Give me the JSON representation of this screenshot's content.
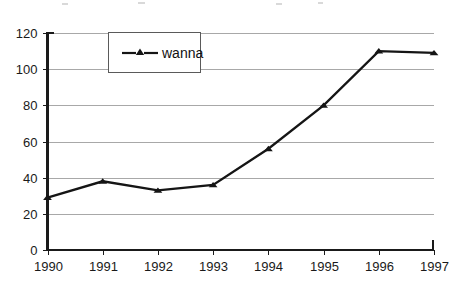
{
  "chart_data": {
    "type": "line",
    "title": "",
    "subtitle": "",
    "xlabel": "",
    "ylabel": "",
    "categories": [
      "1990",
      "1991",
      "1992",
      "1993",
      "1994",
      "1995",
      "1996",
      "1997"
    ],
    "x": [
      1990,
      1991,
      1992,
      1993,
      1994,
      1995,
      1996,
      1997
    ],
    "series": [
      {
        "name": "wanna",
        "values": [
          29,
          38,
          33,
          36,
          56,
          80,
          110,
          109
        ],
        "marker": "triangle",
        "color": "#151515"
      }
    ],
    "ylim": [
      0,
      120
    ],
    "ytick_values": [
      0,
      20,
      40,
      60,
      80,
      100,
      120
    ],
    "ytick_labels": [
      "0",
      "20",
      "40",
      "60",
      "80",
      "100",
      "120"
    ],
    "xtick_labels": [
      "1990",
      "1991",
      "1992",
      "1993",
      "1994",
      "1995",
      "1996",
      "1997"
    ],
    "grid": "horizontal",
    "grid_color": "#a8a8a8",
    "legend_position": "top-center-left",
    "legend_entries": [
      "wanna"
    ],
    "background": "#ffffff",
    "axis_color": "#1a1a1a"
  },
  "legend": {
    "entries": [
      {
        "label": "wanna",
        "marker": "triangle-line-marker"
      }
    ]
  },
  "axes": {
    "y_tick_labels": [
      "120",
      "100",
      "80",
      "60",
      "40",
      "20",
      "0"
    ],
    "x_tick_labels": [
      "1990",
      "1991",
      "1992",
      "1993",
      "1994",
      "1995",
      "1996",
      "1997"
    ]
  }
}
